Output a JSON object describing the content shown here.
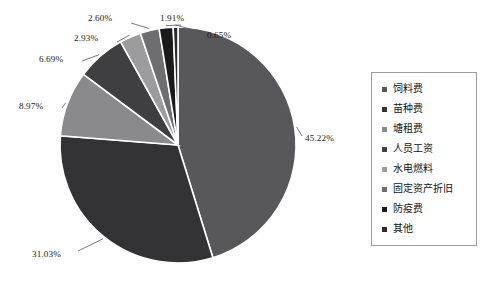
{
  "chart_data": {
    "type": "pie",
    "title": "",
    "subtitle": "",
    "xlabel": "",
    "ylabel": "",
    "grid": false,
    "legend_position": "right",
    "start_angle_deg": 0,
    "direction": "clockwise",
    "categories": [
      "饲料费",
      "苗种费",
      "塘租费",
      "人员工资",
      "水电燃料",
      "固定资产折旧",
      "防疫费",
      "其他"
    ],
    "values": [
      45.22,
      31.03,
      8.97,
      6.69,
      2.93,
      2.6,
      1.91,
      0.65
    ],
    "value_labels": [
      "45.22%",
      "31.03%",
      "8.97%",
      "6.69%",
      "2.93%",
      "2.60%",
      "1.91%",
      "0.65%"
    ],
    "colors": [
      "#58585a",
      "#333335",
      "#8a8a8c",
      "#3f3f41",
      "#9c9c9e",
      "#6e6e70",
      "#1a1a1a",
      "#2a2a2c"
    ],
    "slice_order_note": "drawn clockwise from 12 o'clock: 饲料费 first, then 其他 wraps to just before 12 o'clock"
  },
  "labels": {
    "feed": "45.22%",
    "seedling": "31.03%",
    "pond_rent": "8.97%",
    "staff_wages": "6.69%",
    "utilities": "2.93%",
    "depreciation": "2.60%",
    "epidemic": "1.91%",
    "other": "0.65%"
  },
  "legend": {
    "items": [
      {
        "label": "饲料费",
        "color": "#58585a"
      },
      {
        "label": "苗种费",
        "color": "#333335"
      },
      {
        "label": "塘租费",
        "color": "#8a8a8c"
      },
      {
        "label": "人员工资",
        "color": "#3f3f41"
      },
      {
        "label": "水电燃料",
        "color": "#9c9c9e"
      },
      {
        "label": "固定资产折旧",
        "color": "#6e6e70"
      },
      {
        "label": "防疫费",
        "color": "#1a1a1a"
      },
      {
        "label": "其他",
        "color": "#2a2a2c"
      }
    ]
  },
  "style": {
    "background": "#ffffff",
    "leader_line_color": "#555555",
    "slice_gap_color": "#ffffff",
    "legend_border": "#9a9a9a"
  }
}
